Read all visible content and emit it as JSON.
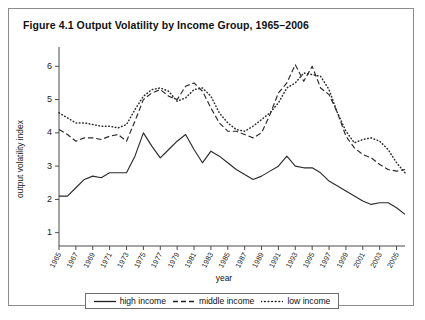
{
  "figure": {
    "title": "Figure 4.1  Output Volatility by Income Group, 1965–2006"
  },
  "legend": {
    "items": [
      {
        "label": "high income",
        "style": "solid"
      },
      {
        "label": "middle income",
        "style": "dashed"
      },
      {
        "label": "low income",
        "style": "dotted"
      }
    ]
  },
  "chart_data": {
    "type": "line",
    "title": "Figure 4.1  Output Volatility by Income Group, 1965–2006",
    "xlabel": "year",
    "ylabel": "output volatility index",
    "xlim": [
      1965,
      2006
    ],
    "ylim": [
      0.6,
      6.4
    ],
    "yticks": [
      1,
      2,
      3,
      4,
      5,
      6
    ],
    "xticks": [
      1965,
      1967,
      1969,
      1971,
      1973,
      1975,
      1977,
      1979,
      1981,
      1983,
      1985,
      1987,
      1989,
      1991,
      1993,
      1995,
      1997,
      1999,
      2001,
      2003,
      2005
    ],
    "grid": false,
    "legend_position": "below-axis",
    "x": [
      1965,
      1966,
      1967,
      1968,
      1969,
      1970,
      1971,
      1972,
      1973,
      1974,
      1975,
      1976,
      1977,
      1978,
      1979,
      1980,
      1981,
      1982,
      1983,
      1984,
      1985,
      1986,
      1987,
      1988,
      1989,
      1990,
      1991,
      1992,
      1993,
      1994,
      1995,
      1996,
      1997,
      1998,
      1999,
      2000,
      2001,
      2002,
      2003,
      2004,
      2005,
      2006
    ],
    "series": [
      {
        "name": "high income",
        "style": "solid",
        "values": [
          2.1,
          2.1,
          2.35,
          2.6,
          2.7,
          2.65,
          2.8,
          2.8,
          2.8,
          3.3,
          4.0,
          3.6,
          3.25,
          3.5,
          3.75,
          3.95,
          3.5,
          3.1,
          3.45,
          3.3,
          3.1,
          2.9,
          2.75,
          2.6,
          2.7,
          2.85,
          3.0,
          3.3,
          3.0,
          2.95,
          2.95,
          2.8,
          2.55,
          2.4,
          2.25,
          2.1,
          1.95,
          1.85,
          1.9,
          1.9,
          1.75,
          1.55
        ]
      },
      {
        "name": "middle income",
        "style": "dashed",
        "values": [
          4.1,
          3.95,
          3.75,
          3.85,
          3.85,
          3.8,
          3.9,
          3.95,
          3.75,
          4.35,
          5.0,
          5.2,
          5.3,
          5.1,
          5.0,
          5.4,
          5.5,
          5.25,
          4.75,
          4.3,
          4.05,
          4.05,
          3.95,
          3.85,
          4.0,
          4.55,
          5.2,
          5.5,
          6.05,
          5.55,
          6.0,
          5.35,
          5.15,
          4.6,
          3.9,
          3.55,
          3.35,
          3.25,
          3.05,
          2.9,
          2.85,
          2.9
        ]
      },
      {
        "name": "low income",
        "style": "dotted",
        "values": [
          4.6,
          4.45,
          4.3,
          4.3,
          4.25,
          4.2,
          4.2,
          4.15,
          4.25,
          4.7,
          5.1,
          5.3,
          5.35,
          5.25,
          4.95,
          5.05,
          5.3,
          5.35,
          5.1,
          4.6,
          4.3,
          4.1,
          4.05,
          4.2,
          4.4,
          4.6,
          4.9,
          5.35,
          5.5,
          5.8,
          5.75,
          5.7,
          5.3,
          4.6,
          4.05,
          3.7,
          3.8,
          3.85,
          3.75,
          3.5,
          3.1,
          2.8
        ]
      }
    ]
  }
}
